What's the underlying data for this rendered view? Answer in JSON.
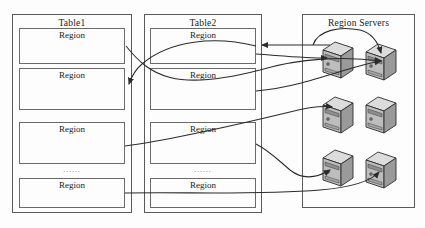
{
  "diagram": {
    "type": "architecture-diagram",
    "background_color": "#fdfdfd",
    "line_color": "#3a3a3a",
    "box_border_color": "#5a5a5a"
  },
  "panels": [
    {
      "id": "table1",
      "title": "Table1",
      "x": 12,
      "y": 14,
      "w": 120,
      "h": 199,
      "regions": [
        {
          "label": "Region",
          "x": 19,
          "y": 28,
          "w": 106,
          "h": 36
        },
        {
          "label": "Region",
          "x": 19,
          "y": 68,
          "w": 106,
          "h": 42
        },
        {
          "label": "Region",
          "x": 19,
          "y": 122,
          "w": 106,
          "h": 42
        },
        {
          "label": "Region",
          "x": 19,
          "y": 178,
          "w": 106,
          "h": 30
        }
      ],
      "ellipsis": {
        "text": "......",
        "x": 19,
        "y": 166,
        "w": 106
      }
    },
    {
      "id": "table2",
      "title": "Table2",
      "x": 144,
      "y": 14,
      "w": 118,
      "h": 199,
      "regions": [
        {
          "label": "Region",
          "x": 150,
          "y": 28,
          "w": 106,
          "h": 36
        },
        {
          "label": "Region",
          "x": 150,
          "y": 68,
          "w": 106,
          "h": 42
        },
        {
          "label": "Region",
          "x": 150,
          "y": 122,
          "w": 106,
          "h": 42
        },
        {
          "label": "Region",
          "x": 150,
          "y": 178,
          "w": 106,
          "h": 30
        }
      ],
      "ellipsis": {
        "text": "......",
        "x": 150,
        "y": 166,
        "w": 106
      }
    },
    {
      "id": "region-servers",
      "title": "Region Servers",
      "x": 302,
      "y": 14,
      "w": 113,
      "h": 194,
      "regions": [],
      "ellipsis": null
    }
  ],
  "servers": [
    {
      "id": "server-1",
      "x": 321,
      "y": 40
    },
    {
      "id": "server-2",
      "x": 364,
      "y": 42
    },
    {
      "id": "server-3",
      "x": 321,
      "y": 95
    },
    {
      "id": "server-4",
      "x": 364,
      "y": 95
    },
    {
      "id": "server-5",
      "x": 321,
      "y": 148
    },
    {
      "id": "server-6",
      "x": 364,
      "y": 150
    }
  ],
  "server_icon": {
    "name": "server-tower-icon",
    "top_face_color": "#d8d8d8",
    "front_face_color": "#b8b8b8",
    "side_face_color": "#8f8f8f",
    "outline_color": "#2e2e2e"
  },
  "connectors": [
    {
      "id": "conn-t1r1-to-server2",
      "from": "table1.region1",
      "to": "server-2"
    },
    {
      "id": "conn-t2r1-to-t1r2",
      "from": "table2.region1",
      "to": "table1.region2"
    },
    {
      "id": "conn-server-to-t2r1",
      "from": "region-servers",
      "to": "table2.region1"
    },
    {
      "id": "conn-t2r1-right-to-server1",
      "from": "table2.region1",
      "to": "server-1"
    },
    {
      "id": "conn-t2r2-to-server4",
      "from": "table2.region2",
      "to": "server-4"
    },
    {
      "id": "conn-t1r3-to-server3",
      "from": "table1.region3",
      "to": "server-3"
    },
    {
      "id": "conn-t2r3-to-server5",
      "from": "table2.region3",
      "to": "server-5"
    },
    {
      "id": "conn-t1r4-to-server6",
      "from": "table1.region4",
      "to": "server-6"
    },
    {
      "id": "conn-server1-loop-to-server2",
      "from": "server-1",
      "to": "server-2"
    }
  ]
}
